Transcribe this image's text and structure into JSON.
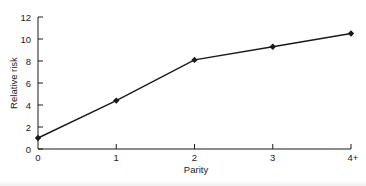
{
  "chart_data": {
    "type": "line",
    "title": "",
    "xlabel": "Parity",
    "ylabel": "Relative risk",
    "categories": [
      "0",
      "1",
      "2",
      "3",
      "4+"
    ],
    "values": [
      1.0,
      4.4,
      8.1,
      9.3,
      10.5
    ],
    "series": [
      {
        "name": "Relative risk",
        "values": [
          1.0,
          4.4,
          8.1,
          9.3,
          10.5
        ],
        "marker": "diamond",
        "color": "#1a1a1a"
      }
    ],
    "ylim": [
      0,
      12
    ],
    "yticks": [
      0,
      2,
      4,
      6,
      8,
      10,
      12
    ],
    "grid": false,
    "legend": null
  },
  "colors": {
    "ink": "#1a1a1a",
    "background": "#ffffff"
  }
}
